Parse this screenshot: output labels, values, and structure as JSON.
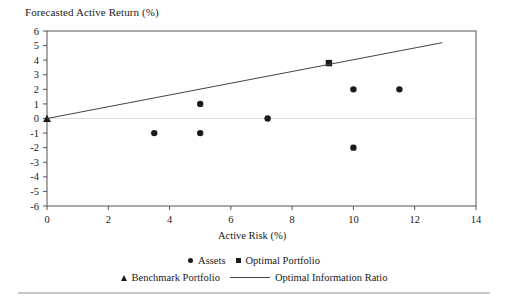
{
  "chart_data": {
    "type": "scatter",
    "title": "Forecasted Active Return (%)",
    "xlabel": "Active Risk (%)",
    "ylabel": "",
    "xlim": [
      0,
      14
    ],
    "ylim": [
      -6,
      6
    ],
    "xticks": [
      0,
      2,
      4,
      6,
      8,
      10,
      12,
      14
    ],
    "yticks": [
      6,
      5,
      4,
      3,
      2,
      1,
      0,
      -1,
      -2,
      -3,
      -4,
      -5,
      -6
    ],
    "xtick_labels": [
      "0",
      "2",
      "4",
      "6",
      "8",
      "10",
      "12",
      "14"
    ],
    "ytick_labels": [
      "6",
      "5",
      "4",
      "3",
      "2",
      "1",
      "0",
      "-1",
      "-2",
      "-3",
      "-4",
      "-5",
      "-6"
    ],
    "grid": false,
    "zero_line": true,
    "legend_position": "bottom",
    "series": [
      {
        "name": "Assets",
        "marker": "circle",
        "color": "#1a1a1a",
        "points": [
          {
            "x": 3.5,
            "y": -1
          },
          {
            "x": 5.0,
            "y": 1
          },
          {
            "x": 5.0,
            "y": -1
          },
          {
            "x": 7.2,
            "y": 0
          },
          {
            "x": 10.0,
            "y": 2
          },
          {
            "x": 10.0,
            "y": -2
          },
          {
            "x": 11.5,
            "y": 2
          }
        ]
      },
      {
        "name": "Optimal Portfolio",
        "marker": "square",
        "color": "#1a1a1a",
        "points": [
          {
            "x": 9.2,
            "y": 3.8
          }
        ]
      },
      {
        "name": "Benchmark Portfolio",
        "marker": "triangle",
        "color": "#1a1a1a",
        "points": [
          {
            "x": 0,
            "y": 0
          }
        ]
      },
      {
        "name": "Optimal Information Ratio",
        "marker": "line",
        "color": "#444444",
        "points": [
          {
            "x": 0,
            "y": 0
          },
          {
            "x": 12.9,
            "y": 5.2
          }
        ]
      }
    ]
  },
  "legend": {
    "row1": [
      {
        "label": "Assets",
        "marker": "circle"
      },
      {
        "label": "Optimal Portfolio",
        "marker": "square"
      }
    ],
    "row2": [
      {
        "label": "Benchmark Portfolio",
        "marker": "triangle"
      },
      {
        "label": "Optimal Information Ratio",
        "marker": "line"
      }
    ]
  },
  "colors": {
    "marker": "#1a1a1a",
    "line": "#444444",
    "axis": "#555555",
    "zero_line": "#dcdcdc",
    "rule": "#c8c8c8"
  }
}
